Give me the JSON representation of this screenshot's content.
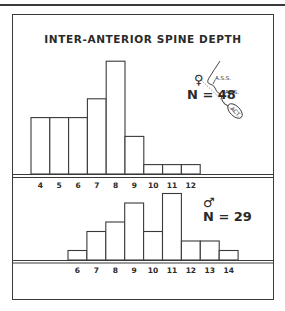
{
  "title": "INTER-ANTERIOR SPINE DEPTH",
  "female": {
    "symbol": "♀",
    "n_label": "N = 48"
  },
  "male": {
    "symbol": "♂",
    "n_label": "N = 29"
  },
  "inset_labels": {
    "ass": "A.S.S.",
    "ais": "A.I.S.",
    "act": "ACT."
  },
  "chart_data": [
    {
      "type": "bar",
      "title": "INTER-ANTERIOR SPINE DEPTH",
      "series_name": "Female",
      "annotation": "N = 48",
      "categories": [
        "4",
        "5",
        "6",
        "7",
        "8",
        "9",
        "10",
        "11",
        "12"
      ],
      "values": [
        6,
        6,
        6,
        8,
        12,
        4,
        1,
        1,
        1
      ],
      "xlabel": "",
      "ylabel": "",
      "grid": false,
      "legend": "none"
    },
    {
      "type": "bar",
      "series_name": "Male",
      "annotation": "N = 29",
      "categories": [
        "6",
        "7",
        "8",
        "9",
        "10",
        "11",
        "12",
        "13",
        "14"
      ],
      "values": [
        1,
        3,
        4,
        6,
        3,
        7,
        2,
        2,
        1
      ],
      "xlabel": "",
      "ylabel": "",
      "grid": false,
      "legend": "none"
    }
  ]
}
